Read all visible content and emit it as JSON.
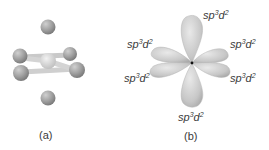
{
  "panels": {
    "a": {
      "label": "(a)",
      "description": "octahedral ball-and-stick molecule",
      "atoms": {
        "center": {
          "x": 48,
          "y": 61,
          "r": 8,
          "color": "#d6d6d6"
        },
        "ligands": [
          {
            "x": 48,
            "y": 27,
            "r": 7.5
          },
          {
            "x": 48,
            "y": 98,
            "r": 7.5
          },
          {
            "x": 20,
            "y": 56,
            "r": 7.5
          },
          {
            "x": 21,
            "y": 73,
            "r": 8
          },
          {
            "x": 70,
            "y": 54,
            "r": 7
          },
          {
            "x": 77,
            "y": 70,
            "r": 8
          }
        ],
        "ligand_color": "#9a9a9a"
      }
    },
    "b": {
      "label": "(b)",
      "description": "six sp3d2 hybrid orbitals",
      "nucleus": {
        "x": 192,
        "y": 63
      },
      "lobe_color": "#c8c8c8",
      "orbital_labels": [
        {
          "base": "sp",
          "sup1": "3",
          "mid": "d",
          "sup2": "2",
          "pos": "top"
        },
        {
          "base": "sp",
          "sup1": "3",
          "mid": "d",
          "sup2": "2",
          "pos": "upper-left"
        },
        {
          "base": "sp",
          "sup1": "3",
          "mid": "d",
          "sup2": "2",
          "pos": "upper-right"
        },
        {
          "base": "sp",
          "sup1": "3",
          "mid": "d",
          "sup2": "2",
          "pos": "lower-left"
        },
        {
          "base": "sp",
          "sup1": "3",
          "mid": "d",
          "sup2": "2",
          "pos": "lower-right"
        },
        {
          "base": "sp",
          "sup1": "3",
          "mid": "d",
          "sup2": "2",
          "pos": "bottom"
        }
      ]
    }
  }
}
